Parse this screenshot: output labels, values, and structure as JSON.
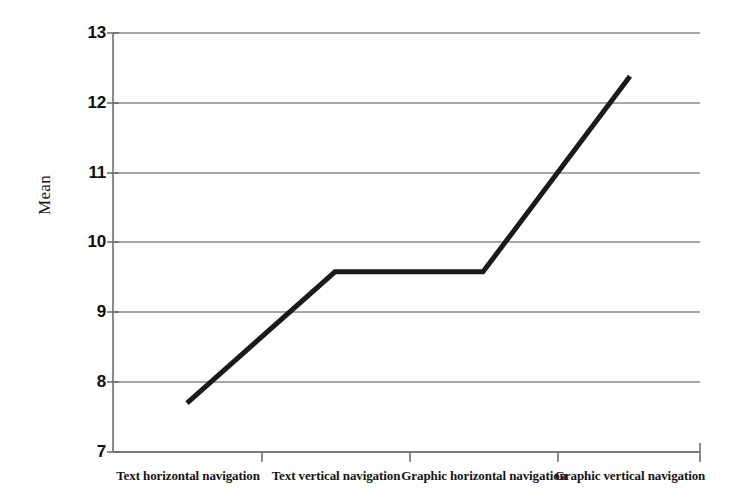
{
  "chart_data": {
    "type": "line",
    "title": "",
    "xlabel": "",
    "ylabel": "Mean",
    "categories": [
      "Text horizontal navigation",
      "Text vertical navigation",
      "Graphic horizontal navigation",
      "Graphic vertical navigation"
    ],
    "values": [
      7.7,
      9.58,
      9.58,
      12.38
    ],
    "series": [
      {
        "name": "Mean",
        "values": [
          7.7,
          9.58,
          9.58,
          12.38
        ]
      }
    ],
    "ylim": [
      7,
      13
    ],
    "yticks": [
      7,
      8,
      9,
      10,
      11,
      12,
      13
    ],
    "ytick_labels": [
      "7",
      "8",
      "9",
      "10",
      "11",
      "12",
      "13"
    ],
    "grid": true,
    "grid_axis": "y",
    "legend": false,
    "legend_position": "none",
    "line_color": "#1a1a1a",
    "line_width_px": 5,
    "grid_color": "#8a8a8a",
    "axis_color": "#6e6e6e",
    "background_color": "#ffffff"
  },
  "axes": {
    "y_title": "Mean",
    "y_tick_0": "7",
    "y_tick_1": "8",
    "y_tick_2": "9",
    "y_tick_3": "10",
    "y_tick_4": "11",
    "y_tick_5": "12",
    "y_tick_6": "13",
    "x_cat_0": "Text horizontal navigation",
    "x_cat_1": "Text vertical navigation",
    "x_cat_2": "Graphic horizontal navigation",
    "x_cat_3": "Graphic vertical navigation"
  }
}
